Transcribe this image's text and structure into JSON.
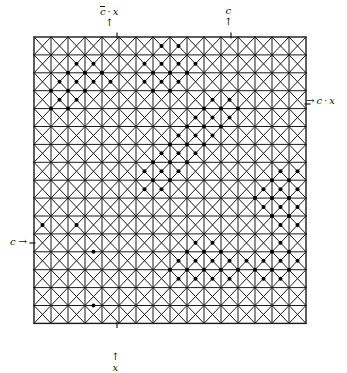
{
  "figure": {
    "background_color": "#ffffff",
    "ink_color": "#111111"
  },
  "grid": {
    "origin_x": 34,
    "origin_y": 37,
    "cols": 16,
    "rows": 16,
    "cell_w": 17.0,
    "cell_h": 17.9,
    "line_color": "#1a1a1a",
    "line_width": 1.0,
    "border_width": 1.4,
    "cell_pattern": "x-cross-with-gridlines",
    "description": "Each square cell is drawn with both diagonals forming an X, plus the horizontal and vertical cell borders."
  },
  "dots": {
    "radius": 2.0,
    "color": "#000000",
    "lattice": "half-cell (half-integer) coordinates; units of cell_w/2 and cell_h/2 from grid origin",
    "points": [
      [
        15,
        1
      ],
      [
        17,
        1
      ],
      [
        13,
        3
      ],
      [
        15,
        3
      ],
      [
        17,
        3
      ],
      [
        19,
        3
      ],
      [
        5,
        3
      ],
      [
        7,
        3
      ],
      [
        14,
        4
      ],
      [
        16,
        4
      ],
      [
        18,
        4
      ],
      [
        4,
        4
      ],
      [
        6,
        4
      ],
      [
        8,
        4
      ],
      [
        13,
        5
      ],
      [
        15,
        5
      ],
      [
        17,
        5
      ],
      [
        3,
        5
      ],
      [
        5,
        5
      ],
      [
        7,
        5
      ],
      [
        9,
        5
      ],
      [
        14,
        6
      ],
      [
        16,
        6
      ],
      [
        2,
        6
      ],
      [
        4,
        6
      ],
      [
        6,
        6
      ],
      [
        3,
        7
      ],
      [
        5,
        7
      ],
      [
        2,
        8
      ],
      [
        4,
        8
      ],
      [
        21,
        7
      ],
      [
        23,
        7
      ],
      [
        20,
        8
      ],
      [
        22,
        8
      ],
      [
        24,
        8
      ],
      [
        19,
        9
      ],
      [
        21,
        9
      ],
      [
        23,
        9
      ],
      [
        18,
        10
      ],
      [
        20,
        10
      ],
      [
        22,
        10
      ],
      [
        17,
        11
      ],
      [
        19,
        11
      ],
      [
        21,
        11
      ],
      [
        16,
        12
      ],
      [
        18,
        12
      ],
      [
        20,
        12
      ],
      [
        15,
        13
      ],
      [
        17,
        13
      ],
      [
        19,
        13
      ],
      [
        14,
        14
      ],
      [
        16,
        14
      ],
      [
        18,
        14
      ],
      [
        13,
        15
      ],
      [
        15,
        15
      ],
      [
        17,
        15
      ],
      [
        14,
        16
      ],
      [
        16,
        16
      ],
      [
        13,
        17
      ],
      [
        15,
        17
      ],
      [
        29,
        15
      ],
      [
        31,
        15
      ],
      [
        28,
        16
      ],
      [
        30,
        16
      ],
      [
        27,
        17
      ],
      [
        29,
        17
      ],
      [
        31,
        17
      ],
      [
        26,
        18
      ],
      [
        28,
        18
      ],
      [
        30,
        18
      ],
      [
        27,
        19
      ],
      [
        29,
        19
      ],
      [
        31,
        19
      ],
      [
        28,
        20
      ],
      [
        30,
        20
      ],
      [
        29,
        21
      ],
      [
        31,
        21
      ],
      [
        1,
        21
      ],
      [
        5,
        21
      ],
      [
        7,
        24
      ],
      [
        19,
        23
      ],
      [
        21,
        23
      ],
      [
        18,
        24
      ],
      [
        20,
        24
      ],
      [
        22,
        24
      ],
      [
        17,
        25
      ],
      [
        19,
        25
      ],
      [
        21,
        25
      ],
      [
        23,
        25
      ],
      [
        25,
        25
      ],
      [
        16,
        26
      ],
      [
        18,
        26
      ],
      [
        20,
        26
      ],
      [
        22,
        26
      ],
      [
        24,
        26
      ],
      [
        17,
        27
      ],
      [
        19,
        27
      ],
      [
        21,
        27
      ],
      [
        23,
        27
      ],
      [
        29,
        23
      ],
      [
        28,
        24
      ],
      [
        30,
        24
      ],
      [
        27,
        25
      ],
      [
        29,
        25
      ],
      [
        31,
        25
      ],
      [
        26,
        26
      ],
      [
        28,
        26
      ],
      [
        30,
        26
      ],
      [
        27,
        27
      ],
      [
        29,
        27
      ],
      [
        7,
        30
      ]
    ]
  },
  "labels": {
    "top_left": {
      "name": "cbar-dot-x",
      "overline_symbol": "c",
      "separator": "·",
      "second_symbol": "x",
      "arrow": "↑",
      "arrow_direction": "up",
      "meaning": "c-bar dot x"
    },
    "top_right": {
      "name": "c",
      "symbol": "c",
      "arrow": "↑",
      "arrow_direction": "up",
      "meaning": "c"
    },
    "right": {
      "name": "c-dot-x",
      "arrow": "→",
      "arrow_direction": "right",
      "symbol": "c",
      "separator": "·",
      "second_symbol": "x",
      "meaning": "c dot x"
    },
    "left": {
      "name": "c",
      "symbol": "c",
      "arrow": "→",
      "arrow_direction": "right",
      "meaning": "c"
    },
    "bottom": {
      "name": "x",
      "symbol": "x",
      "arrow": "↑",
      "arrow_direction": "up",
      "meaning": "x"
    }
  },
  "tick_marks": {
    "top_left_x": 117,
    "top_right_x": 231,
    "bottom_x": 117,
    "right_y": 104,
    "left_y": 243
  }
}
